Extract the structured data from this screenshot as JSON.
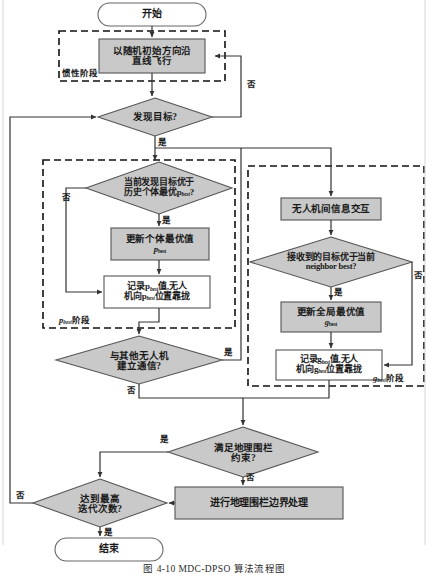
{
  "figure": {
    "caption": "图 4-10   MDC-DPSO 算法流程图",
    "title": "MDC-DPSO 算法流程图"
  },
  "colors": {
    "fill_process": "#c9c9c9",
    "fill_decision": "#c9c9c9",
    "fill_terminator": "#ffffff",
    "fill_record": "#ffffff",
    "stroke": "#555555",
    "text": "#1a1a1a"
  },
  "nodes": {
    "start": "开始",
    "inertia_fly": "以随机初始方向沿\n直线飞行",
    "found_target": "发现目标?",
    "better_than_pbest_1": "当前发现目标优于",
    "better_than_pbest_2": "历史个体最优p",
    "better_than_pbest_sub": "best",
    "better_than_pbest_3": "?",
    "update_pbest_1": "更新个体最优值",
    "update_pbest_2": "p",
    "update_pbest_sub": "best",
    "record_pbest_a1": "记录p",
    "record_pbest_a2": "值,无人",
    "record_pbest_b1": "机向p",
    "record_pbest_b2": "位置靠拢",
    "record_pbest_sub": "best",
    "uav_info_exchange": "无人机间信息交互",
    "better_than_nbest_1": "接收到的目标优于当前",
    "better_than_nbest_2": "neighbor best?",
    "update_gbest_1": "更新全局最优值",
    "update_gbest_2": "g",
    "update_gbest_sub": "best",
    "record_gbest_a1": "记录g",
    "record_gbest_a2": "值,无人",
    "record_gbest_b1": "机向g",
    "record_gbest_b2": "位置靠拢",
    "record_gbest_sub": "best",
    "comm_with_others_1": "与其他无人机",
    "comm_with_others_2": "建立通信?",
    "geofence_ok_1": "满足地理围栏",
    "geofence_ok_2": "约束?",
    "geofence_handle": "进行地理围栏边界处理",
    "max_iter_1": "达到最高",
    "max_iter_2": "迭代次数?",
    "end": "结束"
  },
  "edge_labels": {
    "found_target_no": "否",
    "found_target_yes": "是",
    "pbest_cmp_no": "否",
    "pbest_cmp_yes": "是",
    "nbest_cmp_no": "否",
    "nbest_cmp_yes": "是",
    "comm_yes": "是",
    "comm_no": "否",
    "geofence_yes": "是",
    "geofence_no": "否",
    "max_iter_no": "否",
    "max_iter_yes": "是"
  },
  "stage_labels": {
    "inertia": "惯性阶段",
    "pbest_prefix": "p",
    "pbest_sub": "best",
    "pbest_suffix": "阶段",
    "gbest_prefix": "g",
    "gbest_sub": "best",
    "gbest_suffix": "阶段"
  }
}
